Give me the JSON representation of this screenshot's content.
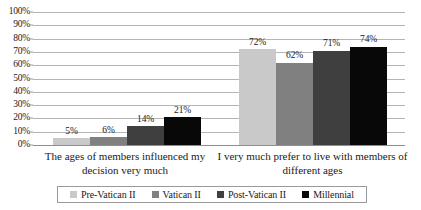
{
  "chart_data": {
    "type": "bar",
    "title": "",
    "subtitle": "",
    "xlabel": "",
    "ylabel": "",
    "ylim": [
      0,
      100
    ],
    "ytick_labels": [
      "100%",
      "90%",
      "80%",
      "70%",
      "60%",
      "50%",
      "40%",
      "30%",
      "20%",
      "10%",
      "0%"
    ],
    "ytick_values": [
      100,
      90,
      80,
      70,
      60,
      50,
      40,
      30,
      20,
      10,
      0
    ],
    "grid": true,
    "legend_position": "bottom",
    "value_suffix": "%",
    "categories": [
      "The ages of members influenced my decision very much",
      "I very much prefer to live with members of different ages"
    ],
    "series": [
      {
        "name": "Pre-Vatican II",
        "color": "#c9c9c9",
        "values": [
          5,
          72
        ],
        "labels": [
          "5%",
          "72%"
        ]
      },
      {
        "name": "Vatican II",
        "color": "#808080",
        "values": [
          6,
          62
        ],
        "labels": [
          "6%",
          "62%"
        ]
      },
      {
        "name": "Post-Vatican II",
        "color": "#3f3f3f",
        "values": [
          14,
          71
        ],
        "labels": [
          "14%",
          "71%"
        ]
      },
      {
        "name": "Millennial",
        "color": "#080808",
        "values": [
          21,
          74
        ],
        "labels": [
          "21%",
          "74%"
        ]
      }
    ]
  }
}
